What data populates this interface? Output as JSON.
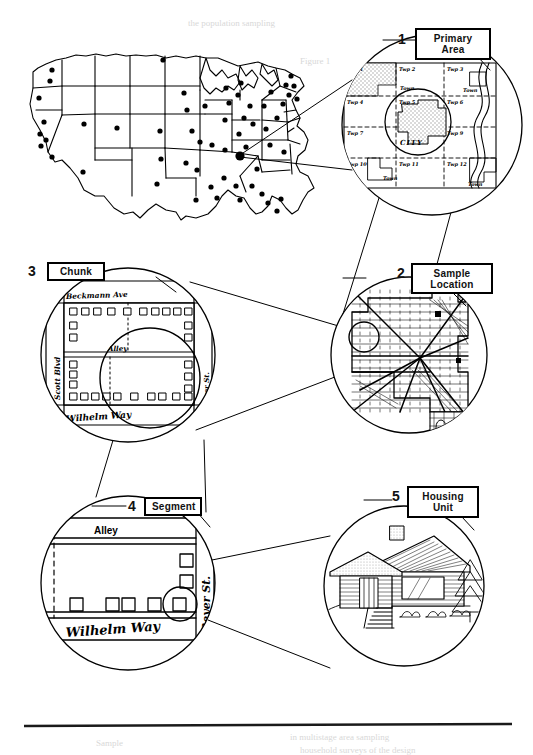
{
  "figure": {
    "type": "multi-stage-sampling-diagram",
    "steps": [
      {
        "number": "1",
        "label_line1": "Primary",
        "label_line2": "Area",
        "detail": "county township grid map with shaded city and river"
      },
      {
        "number": "2",
        "label_line1": "Sample",
        "label_line2": "Location",
        "detail": "city street map with radial arterials and sample circle"
      },
      {
        "number": "3",
        "label_line1": "Chunk",
        "label_line2": "",
        "detail": "city block bounded by streets with individual houses"
      },
      {
        "number": "4",
        "label_line1": "Segment",
        "label_line2": "",
        "detail": "portion of block with selected housing units"
      },
      {
        "number": "5",
        "label_line1": "Housing",
        "label_line2": "Unit",
        "detail": "drawing of a single ranch house"
      }
    ],
    "us_map": {
      "name": "united-states-sample-points-map",
      "point_count": 60,
      "highlighted_point_label": ""
    },
    "primary_area_labels": {
      "city": "CITY",
      "townships": [
        "Twp 1",
        "Twp 2",
        "Twp 3",
        "Twp 4",
        "Twp 5",
        "Twp 6",
        "Twp 7",
        "Twp 8",
        "Twp 9",
        "Twp 10",
        "Twp 11",
        "Twp 12"
      ],
      "towns": [
        "Town",
        "Town",
        "Town",
        "Town"
      ]
    },
    "chunk_streets": {
      "top": "Beckmann Ave",
      "left": "Scott Blvd",
      "middle": "Alley",
      "bottom": "Wilhelm Way",
      "right": "Boyer St."
    },
    "segment_streets": {
      "top": "Alley",
      "bottom": "Wilhelm Way",
      "right": "Beyer St."
    },
    "colors": {
      "ink": "#000000",
      "paper": "#ffffff",
      "shade": "#c9c9c9",
      "rule": "#1a1a1a"
    }
  },
  "footer": {
    "rule_present": "true"
  }
}
